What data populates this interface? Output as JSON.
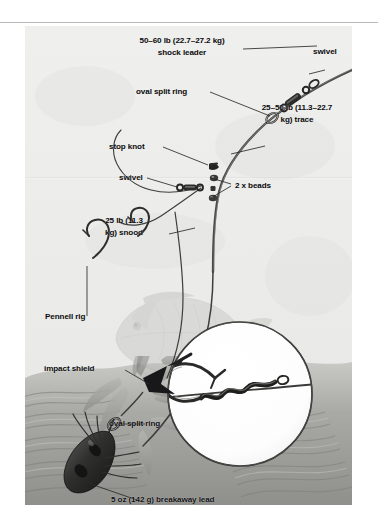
{
  "page": {
    "background_color": "#ffffff",
    "rule_color": "#b9b9b9",
    "plate_background": "#efefef"
  },
  "diagram": {
    "ink_color": "#1a1a1a",
    "labels": [
      {
        "name": "shock-leader-label",
        "line1": "50–60 lb (22.7–27.2 kg)",
        "line2": "shock leader"
      },
      {
        "name": "swivel-top-label",
        "text": "swivel"
      },
      {
        "name": "oval-split-ring-top-label",
        "text": "oval split ring"
      },
      {
        "name": "trace-label",
        "line1": "25–50 lb (11.3–22.7",
        "line2": "kg) trace"
      },
      {
        "name": "stop-knot-label",
        "text": "stop knot"
      },
      {
        "name": "swivel-mid-label",
        "text": "swivel"
      },
      {
        "name": "beads-label",
        "text": "2 x beads"
      },
      {
        "name": "snood-label",
        "line1": "25 lb (11.3",
        "line2": "kg) snood"
      },
      {
        "name": "pennell-rig-label",
        "text": "Pennell rig"
      },
      {
        "name": "impact-shield-label",
        "text": "impact shield"
      },
      {
        "name": "oval-split-ring-bottom-label",
        "text": "oval split ring"
      },
      {
        "name": "breakaway-lead-label",
        "text": "5 oz (142 g) breakaway lead"
      }
    ]
  }
}
